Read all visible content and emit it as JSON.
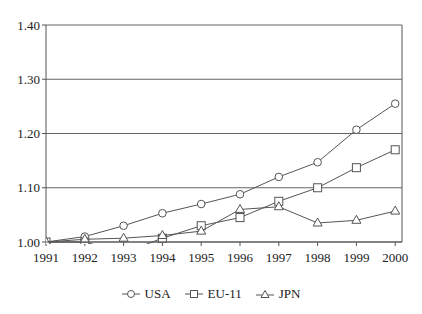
{
  "chart_data": {
    "type": "line",
    "title": "",
    "xlabel": "",
    "ylabel": "",
    "x": [
      1991,
      1992,
      1993,
      1994,
      1995,
      1996,
      1997,
      1998,
      1999,
      2000
    ],
    "x_tick_labels": [
      "1991",
      "1992",
      "1993",
      "1994",
      "1995",
      "1996",
      "1997",
      "1998",
      "1999",
      "2000"
    ],
    "y_tick_labels": [
      "1.00",
      "1.10",
      "1.20",
      "1.30",
      "1.40"
    ],
    "y_ticks": [
      1.0,
      1.1,
      1.2,
      1.3,
      1.4
    ],
    "ylim": [
      1.0,
      1.4
    ],
    "grid": "horizontal",
    "legend_position": "bottom",
    "series": [
      {
        "name": "USA",
        "marker": "circle",
        "values": [
          1.0,
          1.01,
          1.03,
          1.053,
          1.07,
          1.088,
          1.12,
          1.147,
          1.207,
          1.255
        ]
      },
      {
        "name": "EU-11",
        "marker": "square",
        "values": [
          1.0,
          1.0,
          0.98,
          1.007,
          1.03,
          1.045,
          1.075,
          1.1,
          1.137,
          1.17
        ]
      },
      {
        "name": "JPN",
        "marker": "triangle",
        "values": [
          1.0,
          1.005,
          1.007,
          1.012,
          1.02,
          1.06,
          1.065,
          1.035,
          1.04,
          1.057
        ]
      }
    ]
  },
  "legend": {
    "items": [
      {
        "label": "USA",
        "marker": "circle"
      },
      {
        "label": "EU-11",
        "marker": "square"
      },
      {
        "label": "JPN",
        "marker": "triangle"
      }
    ]
  },
  "style": {
    "axis_color": "#555555",
    "grid_color": "#666666",
    "line_color": "#555555",
    "text_color": "#222222"
  }
}
